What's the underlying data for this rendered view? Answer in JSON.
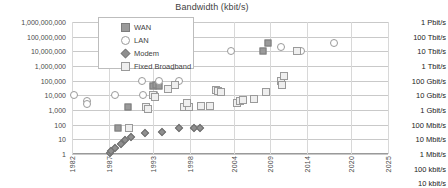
{
  "chart_data": {
    "type": "scatter",
    "title": "Bandwidth (kbit/s)",
    "xlabel": "",
    "ylabel": "kbit/s",
    "yscale": "log",
    "ylim": [
      1,
      1000000000
    ],
    "xlim": [
      1982,
      2025
    ],
    "grid": true,
    "legend_position": "top-left-inside",
    "ytick_labels": [
      "1,000,000,000",
      "100,000,000",
      "10,000,000",
      "1,000,000",
      "100,000",
      "10,000",
      "1,000",
      "100",
      "10",
      "1"
    ],
    "ytick_values": [
      1000000000,
      100000000,
      10000000,
      1000000,
      100000,
      10000,
      1000,
      100,
      10,
      1
    ],
    "secondary_ytick_labels": [
      "1 Pbit/s",
      "100 Tbit/s",
      "10 Tbit/s",
      "1 Tbit/s",
      "100 Gbit/s",
      "10 Gbit/s",
      "1 Gbit/s",
      "100 Mbit/s",
      "10 Mbit/s",
      "1 Mbit/s",
      "100 kbit/s",
      "10 kbit/s"
    ],
    "xtick_labels": [
      "1982",
      "1987",
      "1993",
      "1998",
      "2004",
      "2009",
      "2014",
      "2020",
      "2025"
    ],
    "xtick_values": [
      1982,
      1987,
      1993,
      1998,
      2004,
      2009,
      2014,
      2020,
      2025
    ],
    "series": [
      {
        "name": "WAN",
        "marker": "filled-square",
        "color": "#9a9a9a",
        "points": [
          {
            "x": 1988.2,
            "y": 56
          },
          {
            "x": 1989.6,
            "y": 1544
          },
          {
            "x": 1993.0,
            "y": 44736
          },
          {
            "x": 1993.4,
            "y": 51840
          },
          {
            "x": 1993.2,
            "y": 10000
          },
          {
            "x": 1993.8,
            "y": 45000
          },
          {
            "x": 2008.0,
            "y": 10000000
          },
          {
            "x": 2008.7,
            "y": 40000000
          }
        ]
      },
      {
        "name": "LAN",
        "marker": "open-circle",
        "color": "#9a9a9a",
        "points": [
          {
            "x": 1982.3,
            "y": 10000
          },
          {
            "x": 1984.0,
            "y": 4000
          },
          {
            "x": 1984.0,
            "y": 2500
          },
          {
            "x": 1987.8,
            "y": 10000
          },
          {
            "x": 1991.5,
            "y": 100000
          },
          {
            "x": 1991.6,
            "y": 10000
          },
          {
            "x": 1993.9,
            "y": 100000
          },
          {
            "x": 1995.7,
            "y": 1000000
          },
          {
            "x": 1996.5,
            "y": 100000
          },
          {
            "x": 2003.6,
            "y": 10000000
          },
          {
            "x": 2010.5,
            "y": 20000000
          },
          {
            "x": 2013.2,
            "y": 10000000
          },
          {
            "x": 2017.6,
            "y": 40000000
          }
        ]
      },
      {
        "name": "Modem",
        "marker": "filled-diamond",
        "color": "#8f8f8f",
        "points": [
          {
            "x": 1987.2,
            "y": 1.2
          },
          {
            "x": 1987.3,
            "y": 1.7
          },
          {
            "x": 1987.9,
            "y": 2.4
          },
          {
            "x": 1988.6,
            "y": 4.8
          },
          {
            "x": 1989.2,
            "y": 9.6
          },
          {
            "x": 1990.0,
            "y": 14.4
          },
          {
            "x": 1992.0,
            "y": 28.8
          },
          {
            "x": 1994.2,
            "y": 33.6
          },
          {
            "x": 1996.6,
            "y": 56
          },
          {
            "x": 1998.6,
            "y": 56
          },
          {
            "x": 1999.4,
            "y": 56
          }
        ]
      },
      {
        "name": "Fixed Broadband",
        "marker": "open-square",
        "color": "#efefef",
        "points": [
          {
            "x": 1989.7,
            "y": 56
          },
          {
            "x": 1992.1,
            "y": 1544
          },
          {
            "x": 1992.4,
            "y": 1100
          },
          {
            "x": 1993.0,
            "y": 10000
          },
          {
            "x": 1993.3,
            "y": 8000
          },
          {
            "x": 1995.1,
            "y": 25000
          },
          {
            "x": 1996.0,
            "y": 52000
          },
          {
            "x": 1997.3,
            "y": 1500
          },
          {
            "x": 1997.9,
            "y": 1500
          },
          {
            "x": 1997.6,
            "y": 3000
          },
          {
            "x": 1999.5,
            "y": 2000
          },
          {
            "x": 2000.8,
            "y": 2000
          },
          {
            "x": 2001.6,
            "y": 24000
          },
          {
            "x": 2001.9,
            "y": 20000
          },
          {
            "x": 2002.3,
            "y": 16000
          },
          {
            "x": 2004.5,
            "y": 3000
          },
          {
            "x": 2004.9,
            "y": 4000
          },
          {
            "x": 2005.3,
            "y": 5000
          },
          {
            "x": 2006.8,
            "y": 6000
          },
          {
            "x": 2008.4,
            "y": 16000
          },
          {
            "x": 2010.4,
            "y": 100000
          },
          {
            "x": 2010.6,
            "y": 50000
          },
          {
            "x": 2010.8,
            "y": 200000
          },
          {
            "x": 2012.6,
            "y": 10000000
          }
        ]
      }
    ],
    "legend": [
      {
        "label": "WAN",
        "marker": "filled-square"
      },
      {
        "label": "LAN",
        "marker": "open-circle"
      },
      {
        "label": "Modem",
        "marker": "filled-diamond"
      },
      {
        "label": "Fixed Broadband",
        "marker": "open-square"
      }
    ]
  }
}
